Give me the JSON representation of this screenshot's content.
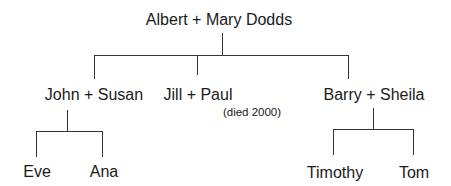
{
  "root": {
    "label": "Albert + Mary Dodds"
  },
  "children": [
    {
      "label": "John + Susan",
      "children": [
        {
          "label": "Eve"
        },
        {
          "label": "Ana"
        }
      ]
    },
    {
      "label": "Jill + Paul",
      "note": "(died 2000)",
      "children": []
    },
    {
      "label": "Barry + Sheila",
      "children": [
        {
          "label": "Timothy"
        },
        {
          "label": "Tom"
        }
      ]
    }
  ],
  "colors": {
    "line": "#333333",
    "text": "#1a1a1a",
    "background": "#ffffff"
  }
}
